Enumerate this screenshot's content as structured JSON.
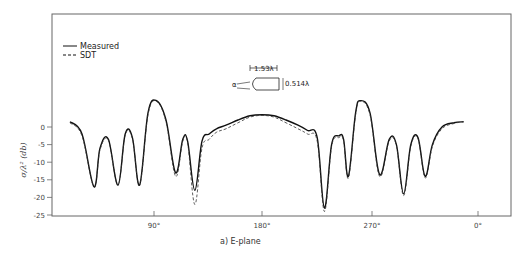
{
  "chart_data": {
    "type": "line",
    "title": "",
    "caption": "a) E-plane",
    "xlabel": "",
    "ylabel": "σ/λ² (db)",
    "x_ticks": [
      "90°",
      "180°",
      "270°",
      "0°"
    ],
    "y_ticks": [
      0,
      -5,
      -10,
      -15,
      -20,
      -25
    ],
    "ylim": [
      -25,
      12
    ],
    "xlim_deg_along_axis": [
      20,
      370
    ],
    "grid": false,
    "legend": {
      "position": "upper-left",
      "entries": [
        {
          "name": "Measured",
          "style": "solid"
        },
        {
          "name": "SDT",
          "style": "dashed"
        }
      ]
    },
    "inset": {
      "length_label": "1.53λ",
      "diameter_label": "0.514λ",
      "angle_label": "α"
    },
    "series": [
      {
        "name": "Measured",
        "style": "solid",
        "x": [
          20,
          30,
          40,
          45,
          52,
          60,
          66,
          72,
          78,
          85,
          92,
          100,
          108,
          114,
          118,
          124,
          130,
          136,
          142,
          150,
          160,
          170,
          180,
          190,
          200,
          210,
          218,
          226,
          232,
          238,
          244,
          248,
          252,
          258,
          262,
          270,
          278,
          286,
          292,
          298,
          304,
          310,
          316,
          322,
          330,
          340,
          348
        ],
        "values": [
          1.5,
          -2,
          -17,
          -6,
          -3.5,
          -16.5,
          -2,
          -3,
          -16.5,
          4,
          7.5,
          2,
          -13,
          -3.5,
          -4,
          -18,
          -4,
          -2,
          -0.5,
          0.5,
          2,
          3.2,
          3.5,
          3.2,
          2,
          0.5,
          -1,
          -3,
          -23,
          -5,
          -2.5,
          -3.5,
          -14,
          4,
          7.5,
          4,
          -13.5,
          -3.5,
          -5,
          -19,
          -5,
          -3,
          -14,
          -5,
          0,
          1.2,
          1.5
        ]
      },
      {
        "name": "SDT",
        "style": "dashed",
        "x": [
          20,
          30,
          40,
          45,
          52,
          60,
          66,
          72,
          78,
          85,
          92,
          100,
          108,
          114,
          118,
          124,
          130,
          136,
          142,
          150,
          160,
          170,
          180,
          190,
          200,
          210,
          218,
          226,
          232,
          238,
          244,
          248,
          252,
          258,
          262,
          270,
          278,
          286,
          292,
          298,
          304,
          310,
          316,
          322,
          330,
          340,
          348
        ],
        "values": [
          1.2,
          -2.5,
          -17,
          -6.5,
          -3.8,
          -16.5,
          -2.3,
          -3.3,
          -16.5,
          3.5,
          7.3,
          1.5,
          -14,
          -4,
          -4.5,
          -22,
          -6,
          -3.5,
          -1.5,
          -0.5,
          1.2,
          2.8,
          3.3,
          2.8,
          1.2,
          -0.5,
          -2,
          -4,
          -24,
          -5.5,
          -3,
          -4,
          -14.5,
          3.5,
          7.3,
          3.5,
          -14,
          -4,
          -5.3,
          -19.5,
          -5.5,
          -3.3,
          -14.5,
          -5.5,
          -0.5,
          1,
          1.5
        ]
      }
    ]
  }
}
